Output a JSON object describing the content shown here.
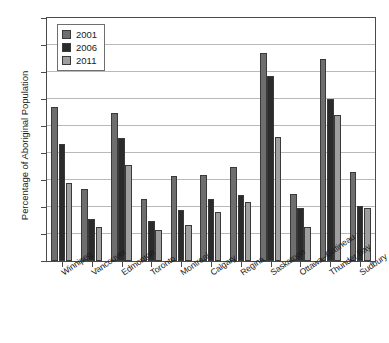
{
  "chart_data": {
    "type": "bar",
    "title": "",
    "xlabel": "",
    "ylabel": "Percentage of Aboriginal Population",
    "ylim": [
      0,
      18
    ],
    "ytick_step": 2,
    "yticks": [
      "0",
      "2",
      "4",
      "6",
      "8",
      "10",
      "12",
      "14",
      "16",
      "18"
    ],
    "grid": true,
    "legend_position": "upper-left-inside",
    "categories": [
      "Winnipeg",
      "Vancouver",
      "Edmonton",
      "Toronto",
      "Montreal",
      "Calgary",
      "Regina",
      "Saskatoon",
      "Ottawa–Gatineau",
      "Thunder Bay",
      "Sudbury"
    ],
    "series": [
      {
        "name": "2001",
        "color": "#6e6e6e",
        "values": [
          11.4,
          5.3,
          11.0,
          4.6,
          6.3,
          6.4,
          7.0,
          15.4,
          5.0,
          15.0,
          6.6
        ]
      },
      {
        "name": "2006",
        "color": "#2b2b2b",
        "values": [
          8.7,
          3.1,
          9.1,
          3.0,
          3.8,
          4.6,
          4.9,
          13.7,
          3.9,
          12.0,
          4.1
        ]
      },
      {
        "name": "2011",
        "color": "#9e9e9e",
        "values": [
          5.8,
          2.5,
          7.1,
          2.3,
          2.7,
          3.6,
          4.4,
          9.2,
          2.5,
          10.8,
          3.9
        ]
      }
    ]
  }
}
